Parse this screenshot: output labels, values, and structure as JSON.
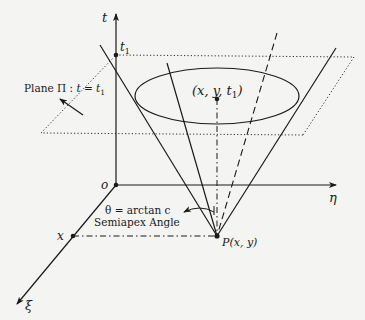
{
  "diagram": {
    "axes": {
      "t_label": "t",
      "eta_label": "η",
      "xi_label": "ξ",
      "origin_label": "o"
    },
    "points": {
      "t1_label": "t",
      "t1_sub": "1",
      "x_label": "x",
      "apex_label": "P(x, y)",
      "center_label": "(x, y, t",
      "center_sub": "1",
      "center_close": ")"
    },
    "plane": {
      "label_prefix": "Plane Π : ",
      "label_eq": "t = t",
      "label_sub": "1"
    },
    "angle": {
      "formula": "θ = arctan c",
      "caption": "Semiapex Angle"
    },
    "colors": {
      "ink": "#1a1a1a",
      "background": "#f4f4f2"
    }
  }
}
